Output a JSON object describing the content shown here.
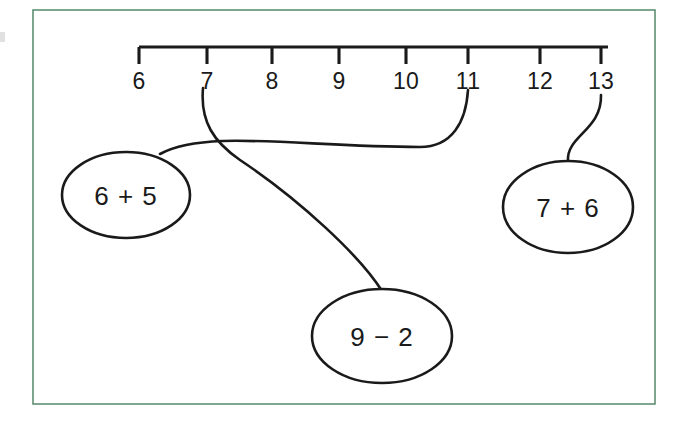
{
  "page": {
    "background_color": "#ffffff",
    "border_color": "#5f8f72",
    "ink_color": "#1a1a1a"
  },
  "number_line": {
    "name": "number-line",
    "axis_start_x": 139,
    "axis_end_x": 608,
    "axis_y": 47,
    "tick_length": 17,
    "ticks": [
      {
        "label": "6",
        "value": 6,
        "x": 139
      },
      {
        "label": "7",
        "value": 7,
        "x": 207
      },
      {
        "label": "8",
        "value": 8,
        "x": 272
      },
      {
        "label": "9",
        "value": 9,
        "x": 339
      },
      {
        "label": "10",
        "value": 10,
        "x": 406
      },
      {
        "label": "11",
        "value": 11,
        "x": 468
      },
      {
        "label": "12",
        "value": 12,
        "x": 540
      },
      {
        "label": "13",
        "value": 13,
        "x": 601
      }
    ]
  },
  "bubbles": [
    {
      "id": "bubble-6-plus-5",
      "label": "6 + 5",
      "expression": "6 + 5",
      "answer": 11,
      "cx": 126,
      "cy": 195,
      "rx": 64,
      "ry": 43
    },
    {
      "id": "bubble-9-minus-2",
      "label": "9 − 2",
      "expression": "9 − 2",
      "answer": 7,
      "cx": 382,
      "cy": 336,
      "rx": 70,
      "ry": 47
    },
    {
      "id": "bubble-7-plus-6",
      "label": "7 + 6",
      "expression": "7 + 6",
      "answer": 13,
      "cx": 568,
      "cy": 207,
      "rx": 65,
      "ry": 46
    }
  ],
  "connectors": [
    {
      "id": "connector-6-plus-5-to-11",
      "from_bubble": "bubble-6-plus-5",
      "to_tick": 11,
      "path": "M 160 154 C 206 129, 300 147, 420 147 C 452 147, 466 122, 468 90"
    },
    {
      "id": "connector-9-minus-2-to-7",
      "from_bubble": "bubble-9-minus-2",
      "to_tick": 7,
      "path": "M 382 291 C 360 256, 300 200, 240 160 C 214 142, 200 122, 203 88"
    },
    {
      "id": "connector-7-plus-6-to-13",
      "from_bubble": "bubble-7-plus-6",
      "to_tick": 13,
      "path": "M 568 161 C 566 136, 602 130, 601 95"
    }
  ],
  "frame": {
    "name": "worksheet-frame",
    "x": 33,
    "y": 10,
    "width": 622,
    "height": 394
  }
}
